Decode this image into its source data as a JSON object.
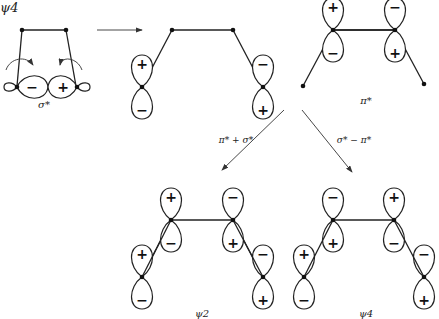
{
  "title_label": "ψ4",
  "panels": {
    "sigma_star": {
      "label": "σ*",
      "lobe_signs": [
        "−",
        "+"
      ]
    },
    "rotated": {
      "top_left_sign": "+",
      "bottom_left_sign": "−",
      "top_right_sign": "−",
      "bottom_right_sign": "+"
    },
    "pi_star": {
      "label": "π*",
      "left_top": "+",
      "left_bottom": "−",
      "right_top": "−",
      "right_bottom": "+"
    },
    "psi2": {
      "label": "ψ2",
      "inner_left_top": "+",
      "inner_left_bottom": "−",
      "inner_right_top": "−",
      "inner_right_bottom": "+",
      "outer_left_top": "+",
      "outer_left_bottom": "−",
      "outer_right_top": "−",
      "outer_right_bottom": "+"
    },
    "psi4": {
      "label": "ψ4",
      "inner_left_top": "−",
      "inner_left_bottom": "+",
      "inner_right_top": "+",
      "inner_right_bottom": "−",
      "outer_left_top": "+",
      "outer_left_bottom": "−",
      "outer_right_top": "−",
      "outer_right_bottom": "+"
    }
  },
  "arrows": {
    "combine_plus": "π* + σ*",
    "combine_minus": "σ* − π*"
  }
}
